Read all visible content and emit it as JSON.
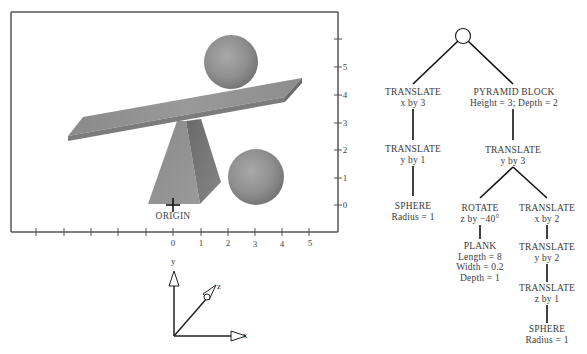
{
  "scene": {
    "origin_label": "ORIGIN",
    "x_tick_labels": [
      "0",
      "1",
      "2",
      "3",
      "4",
      "5"
    ],
    "y_tick_labels": [
      "0",
      "1",
      "2",
      "3",
      "4",
      "5"
    ],
    "objects": [
      "plank",
      "pyramid-block",
      "sphere-on-plank",
      "sphere-on-ground"
    ],
    "colors": {
      "frame": "#444444",
      "object_gray": "#8c8c8c"
    }
  },
  "axes_icon": {
    "x": "x",
    "y": "y",
    "z": "z"
  },
  "tree": {
    "root": "group",
    "nodes": {
      "t_x3": {
        "title": "TRANSLATE",
        "line1": "x by 3"
      },
      "t_y1": {
        "title": "TRANSLATE",
        "line1": "y by 1"
      },
      "sphere1": {
        "title": "SPHERE",
        "line1": "Radius = 1"
      },
      "pyramid": {
        "title": "PYRAMID BLOCK",
        "line1": "Height = 3;  Depth = 2"
      },
      "t_y3": {
        "title": "TRANSLATE",
        "line1": "y by 3"
      },
      "rotate": {
        "title": "ROTATE",
        "line1": "z by  −40°"
      },
      "plank": {
        "title": "PLANK",
        "line1": "Length = 8",
        "line2": "Width = 0.2",
        "line3": "Depth = 1"
      },
      "t_x2": {
        "title": "TRANSLATE",
        "line1": "x by 2"
      },
      "t_y2": {
        "title": "TRANSLATE",
        "line1": "y by 2"
      },
      "t_z1": {
        "title": "TRANSLATE",
        "line1": "z by 1"
      },
      "sphere2": {
        "title": "SPHERE",
        "line1": "Radius = 1"
      }
    }
  }
}
